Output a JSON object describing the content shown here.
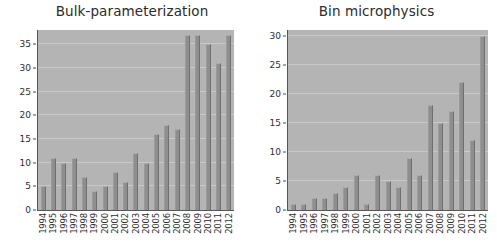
{
  "figure": {
    "background_color": "#ffffff",
    "plot_background_color": "#b4b4b4",
    "bar_color": "#8e8e8e",
    "grid_color": "#c9c9c9"
  },
  "chart_data": [
    {
      "type": "bar",
      "title": "Bulk-parameterization",
      "xlabel": "",
      "ylabel": "",
      "ylim": [
        0,
        38
      ],
      "yticks": [
        0,
        5,
        10,
        15,
        20,
        25,
        30,
        35
      ],
      "ytick_labels": [
        "0",
        "5",
        "10",
        "15",
        "20",
        "25",
        "30",
        "35"
      ],
      "grid": true,
      "legend": "none",
      "categories": [
        "1994",
        "1995",
        "1996",
        "1997",
        "1998",
        "1999",
        "2000",
        "2001",
        "2002",
        "2003",
        "2004",
        "2005",
        "2006",
        "2007",
        "2008",
        "2009",
        "2010",
        "2011",
        "2012"
      ],
      "values": [
        5,
        11,
        10,
        11,
        7,
        4,
        5,
        8,
        6,
        12,
        10,
        16,
        18,
        17,
        37,
        37,
        35,
        31,
        37
      ]
    },
    {
      "type": "bar",
      "title": "Bin microphysics",
      "xlabel": "",
      "ylabel": "",
      "ylim": [
        0,
        31
      ],
      "yticks": [
        0,
        5,
        10,
        15,
        20,
        25,
        30
      ],
      "ytick_labels": [
        "0",
        "5",
        "10",
        "15",
        "20",
        "25",
        "30"
      ],
      "grid": true,
      "legend": "none",
      "categories": [
        "1994",
        "1995",
        "1996",
        "1997",
        "1998",
        "1999",
        "2000",
        "2001",
        "2002",
        "2003",
        "2004",
        "2005",
        "2006",
        "2007",
        "2008",
        "2009",
        "2010",
        "2011",
        "2012"
      ],
      "values": [
        1,
        1,
        2,
        2,
        3,
        4,
        6,
        1,
        6,
        5,
        4,
        9,
        6,
        18,
        15,
        17,
        22,
        12,
        30
      ]
    }
  ]
}
